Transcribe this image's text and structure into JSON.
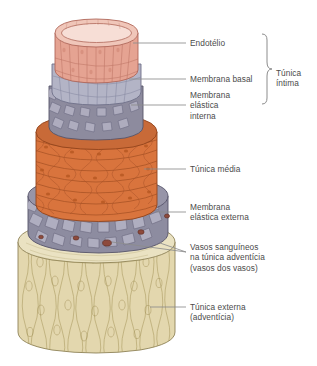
{
  "diagram": {
    "background_color": "#ffffff",
    "text_color": "#4b4b4b",
    "leader_color": "#8c8c8c"
  },
  "labels": {
    "endothelium": "Endotélio",
    "basal_membrane": "Membrana basal",
    "internal_elastic_membrane": "Membrana\nelástica\ninterna",
    "tunica_intima": "Túnica\níntima",
    "tunica_media": "Túnica média",
    "external_elastic_membrane": "Membrana\nelástica externa",
    "vasa_vasorum": "Vasos sanguíneos\nna túnica adventícia\n(vasos dos vasos)",
    "tunica_externa": "Túnica externa\n(adventícia)"
  },
  "layers": [
    {
      "name": "endotelio",
      "label": "Endotélio",
      "color": "#e5a393",
      "edge": "#b4705f"
    },
    {
      "name": "membrana-basal",
      "label": "Membrana basal",
      "color": "#b3b4c6",
      "edge": "#7b7d93"
    },
    {
      "name": "membrana-elastica-interna",
      "label": "Membrana elástica interna",
      "color": "#8d8b9e",
      "edge": "#5d5b6b"
    },
    {
      "name": "tunica-media",
      "label": "Túnica média",
      "color": "#d9763f",
      "edge": "#9a4d22"
    },
    {
      "name": "membrana-elastica-externa",
      "label": "Membrana elástica externa",
      "color": "#8d8b9e",
      "edge": "#5d5b6b"
    },
    {
      "name": "tunica-externa",
      "label": "Túnica externa (adventícia)",
      "color": "#e3d8ae",
      "edge": "#a99c69"
    }
  ],
  "vasa_vasorum_markers": 5
}
